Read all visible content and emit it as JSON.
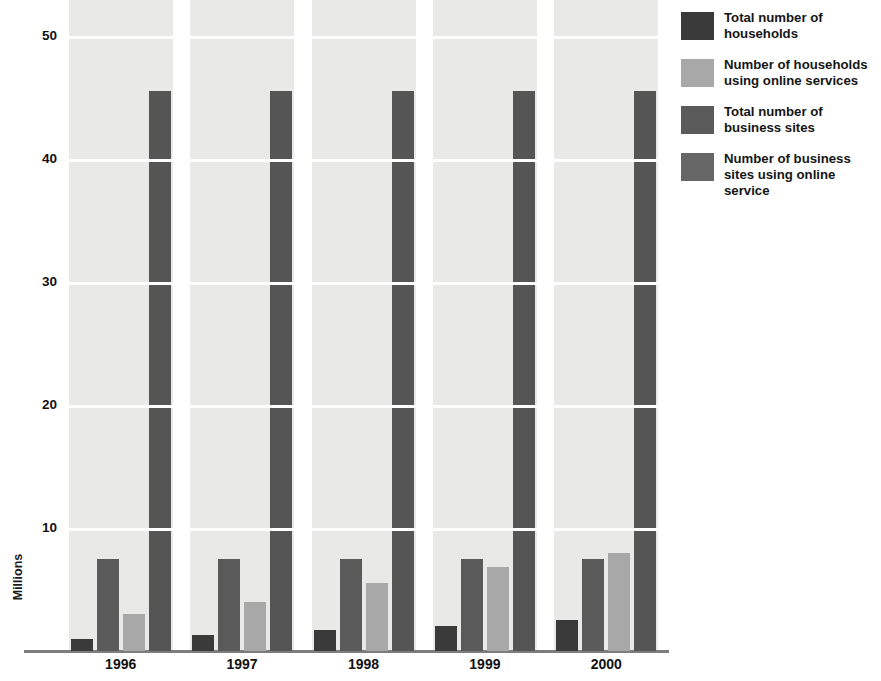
{
  "chart_data": {
    "type": "bar",
    "title": "",
    "subtitle": "",
    "xlabel": "",
    "ylabel": "Millions",
    "categories": [
      "1996",
      "1997",
      "1998",
      "1999",
      "2000"
    ],
    "ylim": [
      0,
      53
    ],
    "yticks": [
      10,
      20,
      30,
      40,
      50
    ],
    "ytick_labels": [
      "10",
      "20",
      "30",
      "40",
      "50"
    ],
    "grid": true,
    "grid_axis": "y",
    "legend_position": "right",
    "series": [
      {
        "name": "Total number of households",
        "color": "#3a3a3a",
        "values": [
          1.0,
          1.3,
          1.7,
          2.0,
          2.5
        ]
      },
      {
        "name": "Number of households using online services",
        "color": "#a8a8a8",
        "values": [
          3.0,
          4.0,
          5.5,
          6.8,
          8.0
        ]
      },
      {
        "name": "Total number of business sites",
        "color": "#5a5a5a",
        "values": [
          7.5,
          7.5,
          7.5,
          7.5,
          7.5
        ]
      },
      {
        "name": "Number of business sites using online service",
        "color": "#555555",
        "values": [
          45.5,
          45.5,
          45.5,
          45.5,
          45.5
        ]
      }
    ],
    "bar_draw_order": [
      0,
      2,
      1,
      3
    ]
  },
  "legend": {
    "items": [
      {
        "label": "Total number of\nhouseholds",
        "swatch_name": "legend-swatch-total-households",
        "color": "#3a3a3a"
      },
      {
        "label": "Number of households\nusing online services",
        "swatch_name": "legend-swatch-households-online",
        "color": "#a8a8a8"
      },
      {
        "label": "Total number of\nbusiness sites",
        "swatch_name": "legend-swatch-total-business-sites",
        "color": "#5a5a5a"
      },
      {
        "label": "Number of business\nsites using online service",
        "swatch_name": "legend-swatch-business-sites-online",
        "color": "#666666"
      }
    ]
  },
  "axes": {
    "y_title": "Millions",
    "y_tick_labels": [
      "50",
      "40",
      "30",
      "20",
      "10"
    ],
    "x_tick_labels": [
      "1996",
      "1997",
      "1998",
      "1999",
      "2000"
    ]
  },
  "colors": {
    "band_background": "#e9e9e7",
    "gridline": "#ffffff",
    "axis_line": "#7d7d7d",
    "text": "#111111"
  }
}
